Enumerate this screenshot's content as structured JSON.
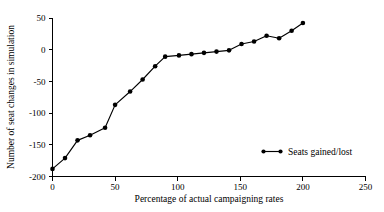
{
  "chart_data": {
    "type": "line",
    "title": "",
    "subtitle": "",
    "xlabel": "Percentage of actual campaigning rates",
    "ylabel": "Number of seat changes in simulation",
    "xlim": [
      0,
      250
    ],
    "ylim": [
      -200,
      50
    ],
    "xticks": [
      0,
      50,
      100,
      150,
      200,
      250
    ],
    "xtick_labels": [
      "0",
      "50",
      "100",
      "150",
      "200",
      "250"
    ],
    "yticks": [
      -200,
      -150,
      -100,
      -50,
      0,
      50
    ],
    "ytick_labels": [
      "-200",
      "-150",
      "-100",
      "-50",
      "0",
      "50"
    ],
    "grid": false,
    "legend_position": "center-right",
    "marker": "filled-circle",
    "line_color": "#000000",
    "marker_color": "#000000",
    "background_color": "#ffffff",
    "series": [
      {
        "name": "Seats gained/lost",
        "x": [
          0,
          10,
          20,
          30,
          42,
          50,
          62,
          72,
          82,
          90,
          101,
          111,
          121,
          131,
          141,
          151,
          161,
          171,
          181,
          191,
          200
        ],
        "values": [
          -188,
          -171,
          -143,
          -135,
          -123,
          -87,
          -66,
          -47,
          -26,
          -11,
          -9,
          -7,
          -5,
          -3,
          -1,
          9,
          13,
          22,
          18,
          30,
          42
        ]
      }
    ]
  },
  "legend": {
    "entries": [
      {
        "label": "Seats gained/lost",
        "marker": "filled-circle",
        "color": "#000000"
      }
    ]
  }
}
